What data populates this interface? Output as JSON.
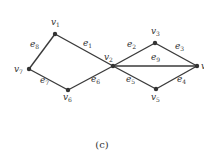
{
  "caption": "(c)",
  "colors": {
    "edge": "#3a3a3a",
    "node": "#333333",
    "background": "#ffffff"
  },
  "nodes": [
    {
      "id": "v1",
      "label": "v",
      "sub": "1",
      "x": 55,
      "y": 34,
      "lx": 51,
      "ly": 25
    },
    {
      "id": "v2",
      "label": "v",
      "sub": "2",
      "x": 113,
      "y": 66,
      "lx": 104,
      "ly": 60
    },
    {
      "id": "v3",
      "label": "v",
      "sub": "3",
      "x": 155,
      "y": 43,
      "lx": 151,
      "ly": 34
    },
    {
      "id": "v4",
      "label": "v",
      "sub": "4",
      "x": 197,
      "y": 66,
      "lx": 201,
      "ly": 69
    },
    {
      "id": "v5",
      "label": "v",
      "sub": "5",
      "x": 156,
      "y": 89,
      "lx": 151,
      "ly": 100
    },
    {
      "id": "v6",
      "label": "v",
      "sub": "6",
      "x": 68,
      "y": 90,
      "lx": 63,
      "ly": 100
    },
    {
      "id": "v7",
      "label": "v",
      "sub": "7",
      "x": 29,
      "y": 69,
      "lx": 14,
      "ly": 72
    }
  ],
  "edges": [
    {
      "id": "e1",
      "label": "e",
      "sub": "1",
      "from": "v1",
      "to": "v2",
      "lx": 83,
      "ly": 46
    },
    {
      "id": "e2",
      "label": "e",
      "sub": "2",
      "from": "v2",
      "to": "v3",
      "lx": 127,
      "ly": 47
    },
    {
      "id": "e3",
      "label": "e",
      "sub": "3",
      "from": "v3",
      "to": "v4",
      "lx": 175,
      "ly": 49
    },
    {
      "id": "e4",
      "label": "e",
      "sub": "4",
      "from": "v5",
      "to": "v4",
      "lx": 177,
      "ly": 82
    },
    {
      "id": "e5",
      "label": "e",
      "sub": "5",
      "from": "v2",
      "to": "v5",
      "lx": 126,
      "ly": 82
    },
    {
      "id": "e6",
      "label": "e",
      "sub": "6",
      "from": "v6",
      "to": "v2",
      "lx": 91,
      "ly": 82
    },
    {
      "id": "e7",
      "label": "e",
      "sub": "7",
      "from": "v7",
      "to": "v6",
      "lx": 40,
      "ly": 83
    },
    {
      "id": "e8",
      "label": "e",
      "sub": "8",
      "from": "v7",
      "to": "v1",
      "lx": 30,
      "ly": 47
    },
    {
      "id": "e9",
      "label": "e",
      "sub": "9",
      "from": "v2",
      "to": "v4",
      "lx": 151,
      "ly": 60
    }
  ]
}
